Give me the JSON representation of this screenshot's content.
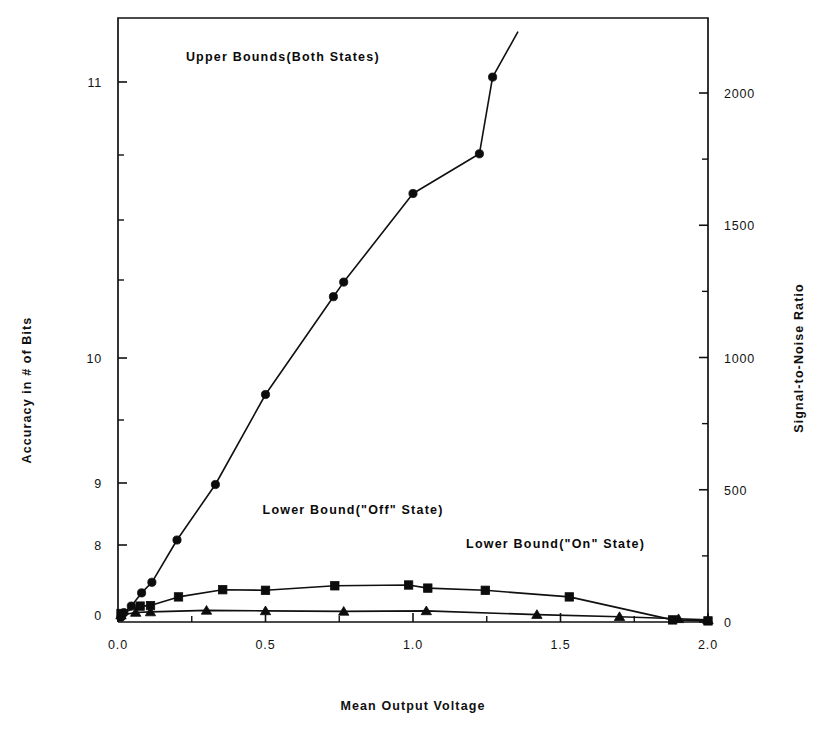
{
  "chart_data": {
    "type": "line",
    "title": "",
    "xlabel": "Mean  Output  Voltage",
    "ylabel": "Accuracy  in  #  of  Bits",
    "y2label": "Signal-to-Noise  Ratio",
    "xlim": [
      0.0,
      2.0
    ],
    "xticks": [
      0.0,
      0.5,
      1.0,
      1.5,
      2.0
    ],
    "xticklabels": [
      "0.0",
      "0.5",
      "1.0",
      "1.5",
      "2.0"
    ],
    "xminorticks": [
      0.25,
      0.75,
      1.25,
      1.75
    ],
    "yticks_left_labels": [
      "11",
      "10",
      "9",
      "8",
      "0"
    ],
    "yticks_left_values": [
      11,
      10,
      9,
      8,
      0
    ],
    "y2lim": [
      0,
      2000
    ],
    "y2ticks": [
      0,
      500,
      1000,
      1500,
      2000
    ],
    "y2ticklabels": [
      "0",
      "500",
      "1000",
      "1500",
      "2000"
    ],
    "y2minorticks": [
      250,
      750,
      1250,
      1750
    ],
    "grid": false,
    "legend_position": "inline-annotations",
    "annotations": [
      {
        "text": "Upper  Bounds(Both  States)",
        "x": 0.23,
        "snr": 2120
      },
      {
        "text": "Lower  Bound(\"Off\"  State)",
        "x": 0.49,
        "snr": 410
      },
      {
        "text": "Lower  Bound(\"On\"  State)",
        "x": 1.18,
        "snr": 280
      }
    ],
    "series": [
      {
        "name": "Upper Bounds (Both States)",
        "marker": "circle",
        "points": [
          {
            "x": 0.01,
            "snr": 18
          },
          {
            "x": 0.02,
            "snr": 35
          },
          {
            "x": 0.045,
            "snr": 60
          },
          {
            "x": 0.08,
            "snr": 110
          },
          {
            "x": 0.115,
            "snr": 150
          },
          {
            "x": 0.2,
            "snr": 310
          },
          {
            "x": 0.33,
            "snr": 520
          },
          {
            "x": 0.5,
            "snr": 860
          },
          {
            "x": 0.73,
            "snr": 1230
          },
          {
            "x": 0.765,
            "snr": 1285
          },
          {
            "x": 1.0,
            "snr": 1620
          },
          {
            "x": 1.225,
            "snr": 1770
          },
          {
            "x": 1.27,
            "snr": 2060
          }
        ],
        "line_exit_x": 1.355,
        "line_exit_snr": 2230
      },
      {
        "name": "Lower Bound (\"Off\" State)",
        "marker": "square",
        "points": [
          {
            "x": 0.01,
            "snr": 32
          },
          {
            "x": 0.075,
            "snr": 60
          },
          {
            "x": 0.11,
            "snr": 62
          },
          {
            "x": 0.205,
            "snr": 95
          },
          {
            "x": 0.355,
            "snr": 122
          },
          {
            "x": 0.5,
            "snr": 120
          },
          {
            "x": 0.735,
            "snr": 137
          },
          {
            "x": 0.985,
            "snr": 140
          },
          {
            "x": 1.05,
            "snr": 128
          },
          {
            "x": 1.245,
            "snr": 120
          },
          {
            "x": 1.53,
            "snr": 95
          },
          {
            "x": 1.88,
            "snr": 8
          },
          {
            "x": 2.0,
            "snr": 4
          }
        ]
      },
      {
        "name": "Lower Bound (\"On\" State)",
        "marker": "triangle",
        "points": [
          {
            "x": 0.01,
            "snr": 26
          },
          {
            "x": 0.06,
            "snr": 36
          },
          {
            "x": 0.11,
            "snr": 38
          },
          {
            "x": 0.3,
            "snr": 44
          },
          {
            "x": 0.5,
            "snr": 42
          },
          {
            "x": 0.765,
            "snr": 40
          },
          {
            "x": 1.045,
            "snr": 42
          },
          {
            "x": 1.42,
            "snr": 28
          },
          {
            "x": 1.7,
            "snr": 20
          },
          {
            "x": 1.9,
            "snr": 12
          },
          {
            "x": 2.0,
            "snr": 8
          }
        ]
      }
    ]
  },
  "colors": {
    "axis": "#111111",
    "data": "#0c0c0c",
    "background": "#ffffff"
  }
}
